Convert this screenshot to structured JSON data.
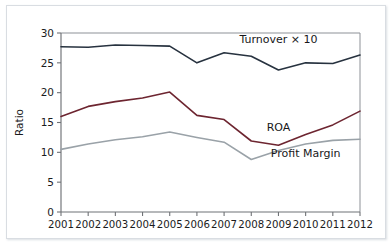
{
  "chart_data": {
    "type": "line",
    "title": "",
    "xlabel": "",
    "ylabel": "Ratio",
    "categories": [
      "2001",
      "2002",
      "2003",
      "2004",
      "2005",
      "2006",
      "2007",
      "2008",
      "2009",
      "2010",
      "2011",
      "2012"
    ],
    "x": [
      2001,
      2002,
      2003,
      2004,
      2005,
      2006,
      2007,
      2008,
      2009,
      2010,
      2011,
      2012
    ],
    "ylim": [
      0,
      30
    ],
    "yticks": [
      0,
      5,
      10,
      15,
      20,
      25,
      30
    ],
    "ytick_labels": [
      "0",
      "5",
      "10",
      "15",
      "20",
      "25",
      "30"
    ],
    "grid": false,
    "legend_position": "inline-annotation",
    "series": [
      {
        "name": "Turnover × 10",
        "color": "#27323f",
        "values": [
          27.7,
          27.6,
          28.0,
          27.9,
          27.8,
          25.0,
          26.7,
          26.1,
          23.8,
          25.0,
          24.9,
          26.3
        ],
        "label_x": 2009.0,
        "label_y": 28.4
      },
      {
        "name": "ROA",
        "color": "#6d2530",
        "values": [
          16.0,
          17.7,
          18.5,
          19.1,
          20.1,
          16.2,
          15.5,
          11.9,
          11.2,
          13.0,
          14.6,
          16.9
        ],
        "label_x": 2009.0,
        "label_y": 13.6
      },
      {
        "name": "Profit Margin",
        "color": "#9aa2a8",
        "values": [
          10.5,
          11.4,
          12.1,
          12.6,
          13.4,
          12.5,
          11.7,
          8.8,
          10.3,
          11.4,
          12.0,
          12.2
        ],
        "label_x": 2010.0,
        "label_y": 9.2
      }
    ]
  },
  "axis": {
    "y_title": "Ratio"
  }
}
